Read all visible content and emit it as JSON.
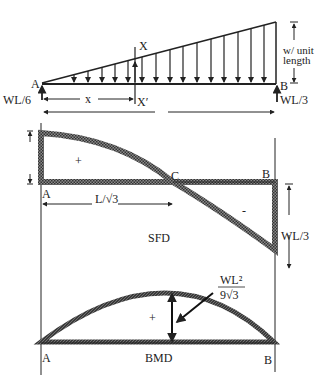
{
  "loading": {
    "support_left": "A",
    "support_right": "B",
    "reaction_left": "WL/6",
    "reaction_right": "WL/3",
    "load_label_line1": "w/ unit",
    "load_label_line2": "length",
    "section_top": "X",
    "section_bottom": "X′",
    "distance": "x"
  },
  "sfd": {
    "point_a": "A",
    "point_b": "B",
    "point_c": "C",
    "zero_distance": "L/√3",
    "positive_sign": "+",
    "negative_sign": "-",
    "max_negative": "WL/3",
    "title": "SFD"
  },
  "bmd": {
    "point_a": "A",
    "point_b": "B",
    "positive_sign": "+",
    "max_numerator": "WL²",
    "max_denominator": "9√3",
    "title": "BMD"
  },
  "colors": {
    "ink": "#222222",
    "hatch": "#555555",
    "background": "#ffffff"
  }
}
